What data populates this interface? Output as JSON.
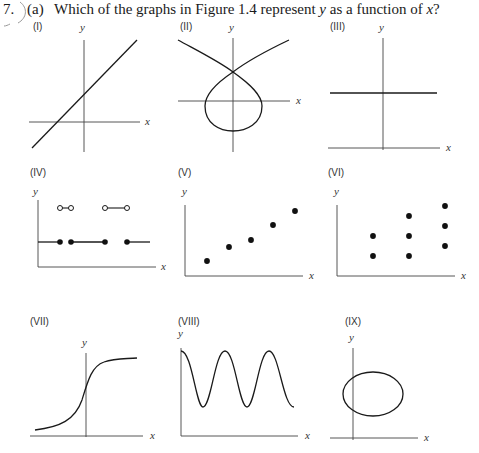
{
  "question": {
    "number": "7.",
    "part": "(a)",
    "text_before": "Which of the graphs in Figure 1.4 represent ",
    "var_y": "y",
    "text_middle": " as a function of ",
    "var_x": "x",
    "text_after": "?"
  },
  "axis_labels": {
    "x": "x",
    "y": "y"
  },
  "panels": [
    {
      "id": "I",
      "label": "(I)",
      "type": "line"
    },
    {
      "id": "II",
      "label": "(II)",
      "type": "curve-loop"
    },
    {
      "id": "III",
      "label": "(III)",
      "type": "horizontal-line"
    },
    {
      "id": "IV",
      "label": "(IV)",
      "type": "step-with-points"
    },
    {
      "id": "V",
      "label": "(V)",
      "type": "scatter"
    },
    {
      "id": "VI",
      "label": "(VI)",
      "type": "scatter-columns"
    },
    {
      "id": "VII",
      "label": "(VII)",
      "type": "sigmoid"
    },
    {
      "id": "VIII",
      "label": "(VIII)",
      "type": "wave"
    },
    {
      "id": "IX",
      "label": "(IX)",
      "type": "ellipse"
    }
  ],
  "colors": {
    "ink": "#1a1a1a",
    "axis": "#444444"
  }
}
